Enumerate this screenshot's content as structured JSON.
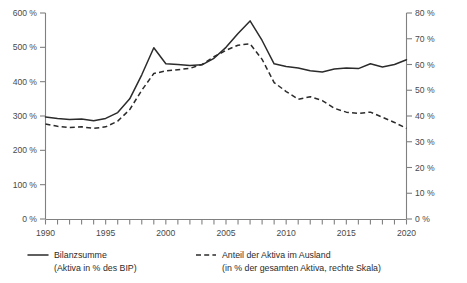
{
  "chart_data": {
    "type": "line",
    "title": "",
    "xlabel": "",
    "ylabel": "",
    "grid": false,
    "legend_position": "bottom",
    "x": [
      1990,
      1991,
      1992,
      1993,
      1994,
      1995,
      1996,
      1997,
      1998,
      1999,
      2000,
      2001,
      2002,
      2003,
      2004,
      2005,
      2006,
      2007,
      2008,
      2009,
      2010,
      2011,
      2012,
      2013,
      2014,
      2015,
      2016,
      2017,
      2018,
      2019,
      2020
    ],
    "xlim": [
      1990,
      2020
    ],
    "xticks_labeled": [
      "1990",
      "1995",
      "2000",
      "2005",
      "2010",
      "2015",
      "2020"
    ],
    "axes": [
      {
        "id": "left",
        "label": "Bilanzsumme (Aktiva in % des BIP)",
        "ylim": [
          0,
          600
        ],
        "ytick_step": 100,
        "ytick_labels": [
          "0 %",
          "100 %",
          "200 %",
          "300 %",
          "400 %",
          "500 %",
          "600 %"
        ],
        "ytick_values": [
          0,
          100,
          200,
          300,
          400,
          500,
          600
        ]
      },
      {
        "id": "right",
        "label": "Anteil der Aktiva im Ausland (in % der gesamten Aktiva)",
        "ylim": [
          0,
          80
        ],
        "ytick_step": 10,
        "ytick_labels": [
          "0 %",
          "10 %",
          "20 %",
          "30 %",
          "40 %",
          "50 %",
          "60 %",
          "70 %",
          "80 %"
        ],
        "ytick_values": [
          0,
          10,
          20,
          30,
          40,
          50,
          60,
          70,
          80
        ]
      }
    ],
    "series": [
      {
        "name": "Bilanzsumme",
        "axis": "left",
        "style": "solid",
        "color": "#2b2b2b",
        "unit": "%",
        "values": [
          297,
          293,
          290,
          291,
          286,
          293,
          310,
          350,
          420,
          499,
          452,
          450,
          447,
          449,
          468,
          500,
          540,
          577,
          520,
          452,
          444,
          440,
          432,
          428,
          437,
          440,
          438,
          452,
          443,
          450,
          464
        ]
      },
      {
        "name": "Anteil der Aktiva im Ausland",
        "axis": "right",
        "style": "dashed",
        "color": "#2b2b2b",
        "unit": "%",
        "values": [
          36.9,
          36.0,
          35.5,
          35.8,
          35.2,
          35.8,
          38.0,
          42.5,
          50.0,
          56.5,
          57.5,
          58.0,
          58.5,
          60.0,
          63.0,
          65.5,
          67.5,
          68.0,
          62.0,
          53.0,
          49.5,
          46.5,
          47.5,
          46.0,
          43.0,
          41.5,
          41.0,
          41.5,
          39.5,
          37.5,
          35.2
        ]
      }
    ]
  },
  "legend": {
    "entries": [
      {
        "style": "solid",
        "title": "Bilanzsumme",
        "subtitle": "(Aktiva in % des BIP)"
      },
      {
        "style": "dashed",
        "title": "Anteil der Aktiva im Ausland",
        "subtitle": "(in % der gesamten Aktiva, rechte Skala)"
      }
    ]
  }
}
